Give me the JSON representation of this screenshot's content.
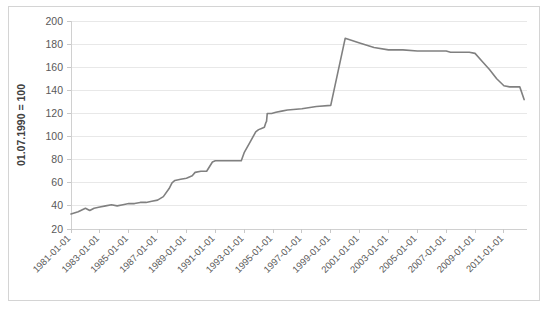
{
  "chart_data": {
    "type": "line",
    "title": "",
    "subtitle": "",
    "xlabel": "",
    "ylabel": "01.07.1990 = 100",
    "ylim": [
      20,
      200
    ],
    "ytick_values": [
      20,
      40,
      60,
      80,
      100,
      120,
      140,
      160,
      180,
      200
    ],
    "ytick_labels": [
      "20",
      "40",
      "60",
      "80",
      "100",
      "120",
      "140",
      "160",
      "180",
      "200"
    ],
    "xtick_labels": [
      "1981-01-01",
      "1983-01-01",
      "1985-01-01",
      "1987-01-01",
      "1989-01-01",
      "1991-01-01",
      "1993-01-01",
      "1995-01-01",
      "1997-01-01",
      "1999-01-01",
      "2001-01-01",
      "2003-01-01",
      "2005-01-01",
      "2007-01-01",
      "2009-01-01",
      "2011-01-01"
    ],
    "xlim": [
      "1981-01-01",
      "2012-07-01"
    ],
    "grid": true,
    "grid_axis": "y",
    "legend": false,
    "legend_position": "none",
    "line_color": "#808080",
    "series": [
      {
        "name": "Index",
        "x": [
          1981.0,
          1981.5,
          1982.0,
          1982.3,
          1982.6,
          1983.0,
          1983.4,
          1983.8,
          1984.2,
          1984.6,
          1985.0,
          1985.4,
          1985.8,
          1986.2,
          1986.6,
          1987.0,
          1987.4,
          1987.8,
          1988.0,
          1988.2,
          1988.6,
          1989.0,
          1989.4,
          1989.6,
          1990.0,
          1990.4,
          1990.8,
          1991.0,
          1991.2,
          1991.6,
          1992.0,
          1992.4,
          1992.8,
          1993.0,
          1993.4,
          1993.8,
          1994.0,
          1994.2,
          1994.4,
          1994.5,
          1994.55,
          1994.6,
          1994.9,
          1995.2,
          1995.6,
          1996.0,
          1997.0,
          1998.0,
          1999.0,
          2000.0,
          2001.0,
          2002.0,
          2003.0,
          2004.0,
          2005.0,
          2005.6,
          2006.0,
          2006.3,
          2006.7,
          2007.0,
          2007.3,
          2007.6,
          2008.0,
          2008.3,
          2008.6,
          2009.0,
          2009.5,
          2010.0,
          2010.5,
          2011.0,
          2011.4,
          2011.8,
          2012.1,
          2012.4
        ],
        "values": [
          33,
          35,
          38,
          36,
          38,
          39,
          40,
          41,
          40,
          41,
          42,
          42,
          43,
          43,
          44,
          45,
          48,
          55,
          60,
          62,
          63,
          64,
          66,
          69,
          70,
          70,
          78,
          79,
          79,
          79,
          79,
          79,
          79,
          86,
          95,
          104,
          106,
          107,
          108,
          112,
          113,
          120,
          120,
          121,
          122,
          123,
          124,
          126,
          127,
          185,
          181,
          177,
          175,
          175,
          174,
          174,
          174,
          174,
          174,
          174,
          173,
          173,
          173,
          173,
          173,
          172,
          165,
          158,
          150,
          144,
          143,
          143,
          143,
          132
        ]
      }
    ]
  }
}
